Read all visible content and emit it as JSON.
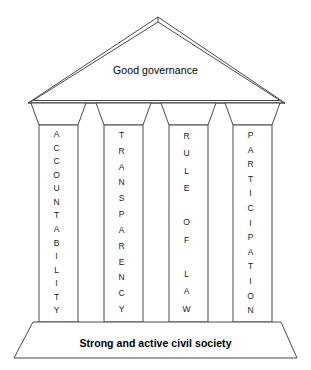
{
  "diagram": {
    "pediment": {
      "label": "Good governance"
    },
    "base": {
      "label": "Strong and active civil society"
    },
    "pillars": [
      {
        "name": "accountability",
        "label": "ACCOUNTABILITY",
        "letters": [
          "A",
          "C",
          "C",
          "O",
          "U",
          "N",
          "T",
          "A",
          "B",
          "I",
          "L",
          "I",
          "T",
          "Y"
        ]
      },
      {
        "name": "transparency",
        "label": "TRANSPARENCY",
        "letters": [
          "T",
          "R",
          "A",
          "N",
          "S",
          "P",
          "A",
          "R",
          "E",
          "N",
          "C",
          "Y"
        ]
      },
      {
        "name": "rule-of-law",
        "label": "RULE OF LAW",
        "letters": [
          "R",
          "U",
          "L",
          "E",
          " ",
          "O",
          "F",
          " ",
          "L",
          "A",
          "W"
        ]
      },
      {
        "name": "participation",
        "label": "PARTICIPATION",
        "letters": [
          "P",
          "A",
          "R",
          "T",
          "I",
          "C",
          "I",
          "P",
          "A",
          "T",
          "I",
          "O",
          "N"
        ]
      }
    ],
    "colors": {
      "background": "#ffffff",
      "stroke": "#4a4a4a",
      "text": "#000000"
    }
  }
}
